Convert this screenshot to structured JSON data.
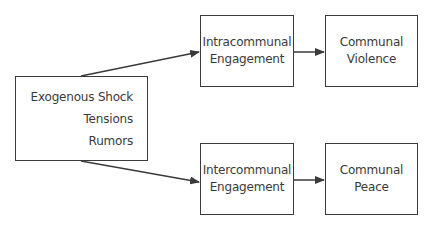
{
  "diagram": {
    "type": "flowchart",
    "source": {
      "lines": [
        "Exogenous Shock",
        "Tensions",
        "Rumors"
      ]
    },
    "upper_path": {
      "engagement": {
        "lines": [
          "Intracommunal",
          "Engagement"
        ]
      },
      "outcome": {
        "lines": [
          "Communal",
          "Violence"
        ]
      }
    },
    "lower_path": {
      "engagement": {
        "lines": [
          "Intercommunal",
          "Engagement"
        ]
      },
      "outcome": {
        "lines": [
          "Communal",
          "Peace"
        ]
      }
    },
    "colors": {
      "stroke": "#3a3a3a",
      "background": "#ffffff",
      "text": "#3a3a3a"
    }
  }
}
